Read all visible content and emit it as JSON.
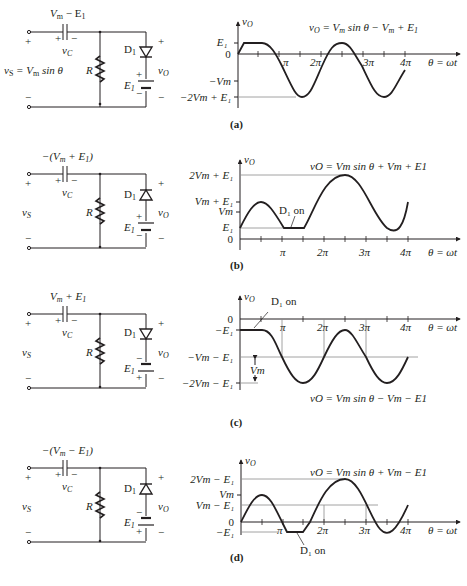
{
  "figure": {
    "panels": [
      {
        "id": "a",
        "caption": "(a)",
        "circuit": {
          "cap_voltage": "V",
          "cap_voltage_sub": "m",
          "cap_voltage_rest": " − E",
          "cap_voltage_rest_sub": "1",
          "cap_label": "v",
          "cap_label_sub": "C",
          "source_label": "v",
          "source_label_sub": "S",
          "source_eq": " = V",
          "source_eq_sub": "m",
          "source_eq_rest": " sin θ",
          "resistor": "R",
          "diode": "D",
          "diode_sub": "1",
          "diode_orientation": "down",
          "battery": "E",
          "battery_sub": "1",
          "battery_top_sign": "+",
          "battery_bottom_sign": "−",
          "out_label": "v",
          "out_label_sub": "O",
          "plus": "+",
          "minus": "−"
        },
        "graph": {
          "y_axis": "v",
          "y_axis_sub": "O",
          "equation": "v",
          "equation_sub": "O",
          "equation_rest": " = V",
          "equation_rest_sub": "m",
          "equation_tail": " sin θ − V",
          "equation_tail_sub": "m",
          "equation_end": " + E",
          "equation_end_sub": "1",
          "y_labels": [
            "E₁",
            "0",
            "−Vm",
            "−2Vm + E₁"
          ],
          "x_labels": [
            "π",
            "2π",
            "3π",
            "4π"
          ],
          "x_axis": "θ = ωt"
        }
      },
      {
        "id": "b",
        "caption": "(b)",
        "circuit": {
          "cap_voltage": "−(V",
          "cap_voltage_sub": "m",
          "cap_voltage_rest": " + E",
          "cap_voltage_rest_sub": "1",
          "cap_voltage_end": ")",
          "cap_label": "v",
          "cap_label_sub": "C",
          "source_label": "v",
          "source_label_sub": "S",
          "resistor": "R",
          "diode": "D",
          "diode_sub": "1",
          "diode_orientation": "up",
          "battery": "E",
          "battery_sub": "1",
          "battery_top_sign": "+",
          "battery_bottom_sign": "−",
          "out_label": "v",
          "out_label_sub": "O",
          "plus": "+",
          "minus": "−"
        },
        "graph": {
          "y_axis": "v",
          "y_axis_sub": "O",
          "equation": "vO = Vm sin θ + Vm + E1",
          "y_labels": [
            "2Vm + E₁",
            "Vm + E₁",
            "Vm",
            "E₁",
            "0"
          ],
          "x_labels": [
            "π",
            "2π",
            "3π",
            "4π"
          ],
          "x_axis": "θ = ωt",
          "annotation": "D₁ on"
        }
      },
      {
        "id": "c",
        "caption": "(c)",
        "circuit": {
          "cap_voltage": "V",
          "cap_voltage_sub": "m",
          "cap_voltage_rest": " + E",
          "cap_voltage_rest_sub": "1",
          "cap_label": "v",
          "cap_label_sub": "C",
          "source_label": "v",
          "source_label_sub": "S",
          "resistor": "R",
          "diode": "D",
          "diode_sub": "1",
          "diode_orientation": "down",
          "battery": "E",
          "battery_sub": "1",
          "battery_top_sign": "−",
          "battery_bottom_sign": "+",
          "out_label": "v",
          "out_label_sub": "O",
          "plus": "+",
          "minus": "−"
        },
        "graph": {
          "y_axis": "v",
          "y_axis_sub": "O",
          "equation": "vO = Vm sin θ − Vm − E1",
          "y_labels": [
            "0",
            "−E₁",
            "−Vm − E₁",
            "−2Vm − E₁"
          ],
          "x_labels": [
            "π",
            "2π",
            "3π",
            "4π"
          ],
          "x_axis": "θ = ωt",
          "annotation": "D₁ on",
          "dimension": "Vm"
        }
      },
      {
        "id": "d",
        "caption": "(d)",
        "circuit": {
          "cap_voltage": "−(V",
          "cap_voltage_sub": "m",
          "cap_voltage_rest": " − E",
          "cap_voltage_rest_sub": "1",
          "cap_voltage_end": ")",
          "cap_label": "v",
          "cap_label_sub": "C",
          "source_label": "v",
          "source_label_sub": "S",
          "resistor": "R",
          "diode": "D",
          "diode_sub": "1",
          "diode_orientation": "up",
          "battery": "E",
          "battery_sub": "1",
          "battery_top_sign": "−",
          "battery_bottom_sign": "+",
          "out_label": "v",
          "out_label_sub": "O",
          "plus": "+",
          "minus": "−"
        },
        "graph": {
          "y_axis": "v",
          "y_axis_sub": "O",
          "equation": "vO = Vm sin θ + Vm − E1",
          "y_labels": [
            "2Vm − E₁",
            "Vm",
            "Vm − E₁",
            "0",
            "−E₁"
          ],
          "x_labels": [
            "π",
            "2π",
            "3π",
            "4π"
          ],
          "x_axis": "θ = ωt",
          "annotation": "D₁ on"
        }
      }
    ]
  }
}
